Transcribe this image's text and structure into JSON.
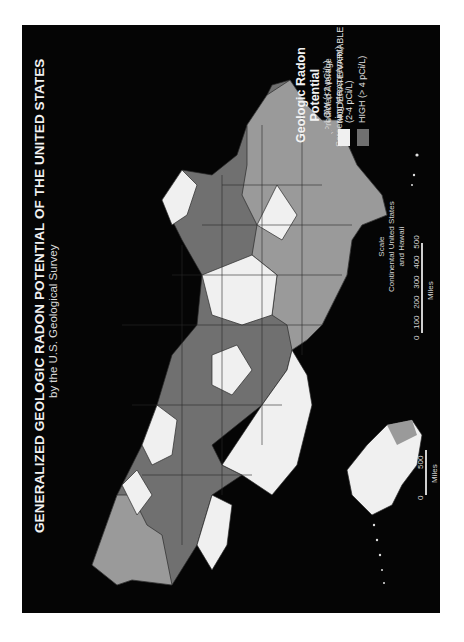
{
  "map": {
    "title": "GENERALIZED GEOLOGIC RADON POTENTIAL OF THE UNITED STATES",
    "subtitle": "by the U.S. Geological Survey",
    "orientation": "rotated 90° counter-clockwise",
    "background_color": "#050505"
  },
  "legend": {
    "title_line1": "Geologic Radon",
    "title_line2": "Potential",
    "subtitle_line1": "(Predicted Average",
    "subtitle_line2": "Screening Measurement)",
    "items": [
      {
        "label": "LOW (<2 pCi/L)",
        "color": "#9a9a9a"
      },
      {
        "label_line1": "MODERATE/VARIABLE",
        "label_line2": "(2-4 pCi/L)",
        "color": "#f0f0f0"
      },
      {
        "label": "HIGH (> 4 pCi/L)",
        "color": "#707070"
      }
    ]
  },
  "scale_conus": {
    "title": "Scale",
    "line1": "Continental United States",
    "line2": "and Hawaii",
    "ticks": [
      "0",
      "100",
      "200",
      "300",
      "400",
      "500"
    ],
    "unit": "Miles"
  },
  "scale_alaska": {
    "ticks": [
      "0",
      "500"
    ],
    "unit": "Miles"
  }
}
